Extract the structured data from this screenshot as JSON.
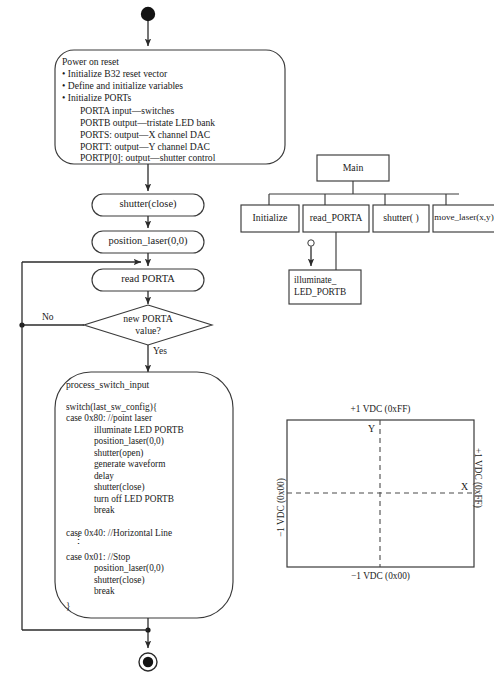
{
  "diagram": {
    "start_node": "filled-circle-start",
    "end_node": "bullseye-end"
  },
  "flow": {
    "power_on_reset": {
      "heading": "Power on reset",
      "bullets": [
        "• Initialize B32 reset vector",
        "• Define and initialize variables",
        "• Initialize PORTs"
      ],
      "ports": [
        "PORTA input—switches",
        "PORTB output—tristate LED bank",
        "PORTS: output—X channel DAC",
        "PORTT: output—Y channel DAC",
        "PORTP[0]: output—shutter control"
      ]
    },
    "shutter_close": "shutter(close)",
    "position_laser": "position_laser(0,0)",
    "read_porta": "read PORTA",
    "decision": {
      "line1": "new PORTA",
      "line2": "value?",
      "no_label": "No",
      "yes_label": "Yes"
    },
    "process_switch_input": {
      "heading": "process_switch_input",
      "lines": [
        "switch(last_sw_config){",
        "case 0x80: //point laser",
        "            illuminate LED PORTB",
        "            position_laser(0,0)",
        "            shutter(open)",
        "            generate waveform",
        "            delay",
        "            shutter(close)",
        "            turn off LED PORTB",
        "            break"
      ],
      "case40": "case 0x40: //Horizontal Line",
      "ellipsis": "⋮",
      "lines2": [
        "case 0x01: //Stop",
        "            position_laser(0,0)",
        "            shutter(close)",
        "            break"
      ],
      "closing_brace": "}"
    }
  },
  "hierarchy": {
    "root": "Main",
    "children": [
      "Initialize",
      "read_PORTA",
      "shutter( )",
      "move_laser(x,y)"
    ],
    "sub": {
      "parent": "read_PORTA",
      "line1": "illuminate_",
      "line2": "LED_PORTB"
    }
  },
  "scan_field": {
    "top_label": "+1 VDC (0xFF)",
    "bottom_label": "−1 VDC (0x00)",
    "left_label": "−1 VDC (0x00)",
    "right_label": "+1 VDC (0xFF)",
    "y_axis_label": "Y",
    "x_axis_label": "X"
  },
  "colors": {
    "stroke": "#3a3a3a",
    "text": "#1a1a1a",
    "background": "#ffffff"
  }
}
